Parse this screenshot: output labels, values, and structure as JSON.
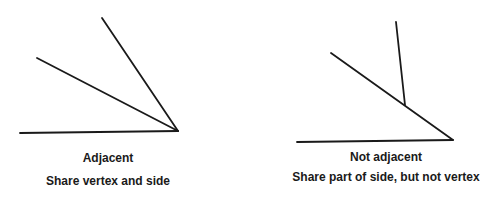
{
  "figures": [
    {
      "title": "Adjacent",
      "caption": "Share vertex and side",
      "lines": [
        {
          "name": "base-ray",
          "x1": 20,
          "y1": 133,
          "x2": 178,
          "y2": 131
        },
        {
          "name": "middle-ray",
          "x1": 37,
          "y1": 58,
          "x2": 178,
          "y2": 131
        },
        {
          "name": "upper-ray",
          "x1": 102,
          "y1": 18,
          "x2": 178,
          "y2": 131
        }
      ]
    },
    {
      "title": "Not adjacent",
      "caption": "Share part of side, but not vertex",
      "lines": [
        {
          "name": "base-ray",
          "x1": 297,
          "y1": 142,
          "x2": 453,
          "y2": 140
        },
        {
          "name": "slanted-ray",
          "x1": 331,
          "y1": 53,
          "x2": 453,
          "y2": 140
        },
        {
          "name": "short-ray",
          "x1": 396,
          "y1": 22,
          "x2": 405,
          "y2": 105
        }
      ]
    }
  ],
  "colors": {
    "line": "#1a1a1a",
    "background": "#ffffff"
  }
}
